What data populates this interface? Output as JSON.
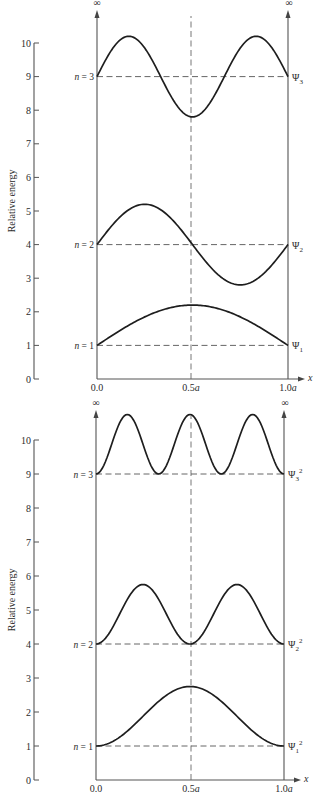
{
  "figure": {
    "panels": [
      {
        "id": "wavefunctions",
        "yaxis": {
          "title": "Relative energy",
          "ticks": [
            "0",
            "1",
            "2",
            "3",
            "4",
            "5",
            "6",
            "7",
            "8",
            "9",
            "10"
          ],
          "x": 34,
          "y0": 379,
          "unit": 33.6
        },
        "plot": {
          "left": 97,
          "right": 288,
          "bottom": 379,
          "top": 10,
          "center": 191
        },
        "xaxis": {
          "labels": [
            "0.0",
            "0.5a",
            "1.0a"
          ],
          "var": "x",
          "label_y": 391
        },
        "infinity": "∞",
        "levels": [
          {
            "n_label": "n = 1",
            "energy": 1,
            "wave_label": "Ψ1",
            "wave_base": "Ψ",
            "wave_sub": "1",
            "wave_sup": ""
          },
          {
            "n_label": "n = 2",
            "energy": 4,
            "wave_label": "Ψ2",
            "wave_base": "Ψ",
            "wave_sub": "2",
            "wave_sup": ""
          },
          {
            "n_label": "n = 3",
            "energy": 9,
            "wave_label": "Ψ3",
            "wave_base": "Ψ",
            "wave_sub": "3",
            "wave_sup": ""
          }
        ],
        "kind": "psi",
        "amplitude": 1.2
      },
      {
        "id": "probability",
        "yaxis": {
          "title": "Relative energy",
          "ticks": [
            "0",
            "1",
            "2",
            "3",
            "4",
            "5",
            "6",
            "7",
            "8",
            "9",
            "10"
          ],
          "x": 34,
          "y0": 780,
          "unit": 34.0
        },
        "plot": {
          "left": 96,
          "right": 284,
          "bottom": 780,
          "top": 410,
          "center": 191
        },
        "xaxis": {
          "labels": [
            "0.0",
            "0.5a",
            "1.0a"
          ],
          "var": "x",
          "label_y": 792
        },
        "infinity": "∞",
        "levels": [
          {
            "n_label": "n = 1",
            "energy": 1,
            "wave_label": "Ψ1²",
            "wave_base": "Ψ",
            "wave_sub": "1",
            "wave_sup": "2"
          },
          {
            "n_label": "n = 2",
            "energy": 4,
            "wave_label": "Ψ2²",
            "wave_base": "Ψ",
            "wave_sub": "2",
            "wave_sup": "2"
          },
          {
            "n_label": "n = 3",
            "energy": 9,
            "wave_label": "Ψ3²",
            "wave_base": "Ψ",
            "wave_sub": "3",
            "wave_sup": "2"
          }
        ],
        "kind": "psi2",
        "amplitude": 1.75
      }
    ]
  }
}
